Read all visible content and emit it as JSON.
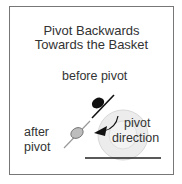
{
  "diagram": {
    "title_line1": "Pivot Backwards",
    "title_line2": "Towards the Basket",
    "labels": {
      "before": "before pivot",
      "after_line1": "after",
      "after_line2": "pivot",
      "direction_line1": "pivot",
      "direction_line2": "direction"
    },
    "colors": {
      "border": "#777777",
      "before_player": "#111111",
      "after_player": "#b8b8b8",
      "basket_rings": "#e6e6e6",
      "baseline": "#222222"
    }
  }
}
